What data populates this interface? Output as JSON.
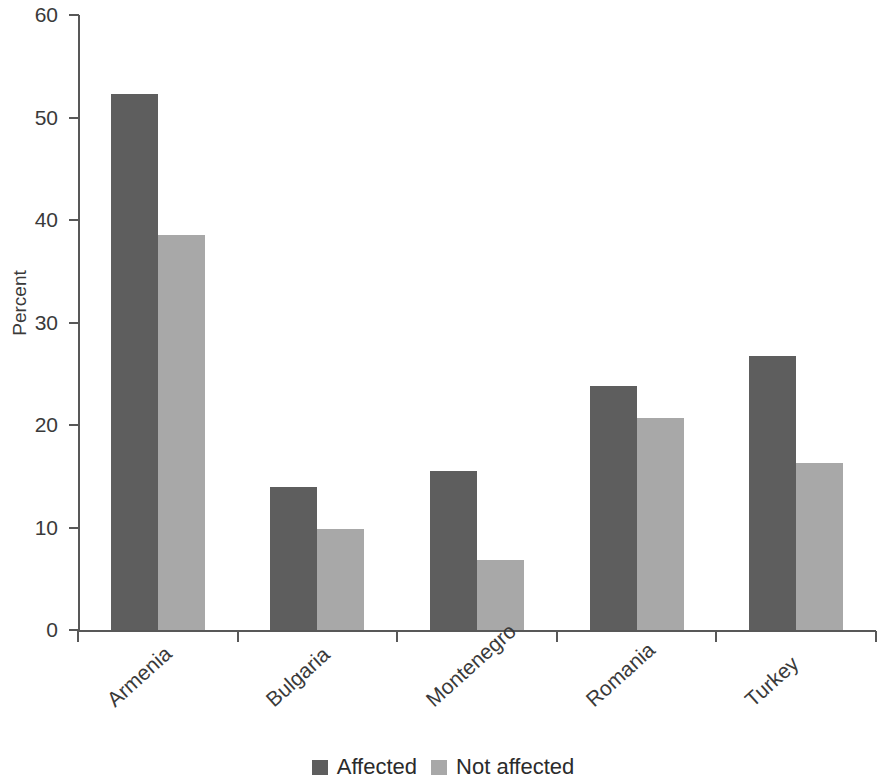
{
  "chart_data": {
    "type": "bar",
    "title": "",
    "subtitle": "",
    "xlabel": "",
    "ylabel": "Percent",
    "categories": [
      "Armenia",
      "Bulgaria",
      "Montenegro",
      "Romania",
      "Turkey"
    ],
    "series": [
      {
        "name": "Affected",
        "color": "#5e5e5e",
        "values": [
          52.3,
          14.0,
          15.5,
          23.8,
          26.7
        ]
      },
      {
        "name": "Not affected",
        "color": "#a8a8a8",
        "values": [
          38.5,
          9.9,
          6.8,
          20.7,
          16.3
        ]
      }
    ],
    "ylim": [
      0,
      60
    ],
    "yticks": [
      0,
      10,
      20,
      30,
      40,
      50,
      60
    ],
    "ytick_labels": [
      "0",
      "10",
      "20",
      "30",
      "40",
      "50",
      "60"
    ],
    "grid": false,
    "legend_position": "bottom-center",
    "annotations": []
  },
  "axes": {
    "y_title": "Percent"
  },
  "legend": {
    "items": [
      {
        "label": "Affected",
        "swatch": "affected"
      },
      {
        "label": "Not affected",
        "swatch": "not-affected"
      }
    ]
  }
}
